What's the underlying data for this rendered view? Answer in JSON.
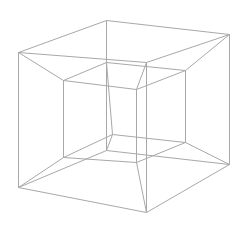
{
  "diagram": {
    "title": "",
    "stroke_color": "#a8a8a8",
    "background": "#ffffff",
    "vertices": {
      "A": [
        18,
        52
      ],
      "B": [
        106,
        20
      ],
      "C": [
        229,
        34
      ],
      "D": [
        146,
        62
      ],
      "E": [
        18,
        187
      ],
      "F": [
        106,
        150
      ],
      "G": [
        229,
        164
      ],
      "H": [
        146,
        212
      ],
      "a": [
        63,
        80
      ],
      "b": [
        106,
        62
      ],
      "c": [
        185,
        70
      ],
      "d": [
        136,
        89
      ],
      "e": [
        63,
        157
      ],
      "f": [
        112,
        134
      ],
      "g": [
        185,
        142
      ],
      "h": [
        136,
        162
      ]
    },
    "edges": [
      [
        "A",
        "B"
      ],
      [
        "B",
        "C"
      ],
      [
        "A",
        "D"
      ],
      [
        "D",
        "C"
      ],
      [
        "E",
        "F"
      ],
      [
        "F",
        "G"
      ],
      [
        "E",
        "H"
      ],
      [
        "H",
        "G"
      ],
      [
        "A",
        "E"
      ],
      [
        "B",
        "F"
      ],
      [
        "C",
        "G"
      ],
      [
        "D",
        "H"
      ],
      [
        "a",
        "b"
      ],
      [
        "b",
        "c"
      ],
      [
        "a",
        "d"
      ],
      [
        "d",
        "c"
      ],
      [
        "e",
        "f"
      ],
      [
        "f",
        "g"
      ],
      [
        "e",
        "h"
      ],
      [
        "h",
        "g"
      ],
      [
        "a",
        "e"
      ],
      [
        "b",
        "f"
      ],
      [
        "c",
        "g"
      ],
      [
        "d",
        "h"
      ],
      [
        "A",
        "a"
      ],
      [
        "B",
        "b"
      ],
      [
        "C",
        "c"
      ],
      [
        "D",
        "d"
      ],
      [
        "E",
        "e"
      ],
      [
        "F",
        "f"
      ],
      [
        "G",
        "g"
      ],
      [
        "H",
        "h"
      ]
    ]
  }
}
